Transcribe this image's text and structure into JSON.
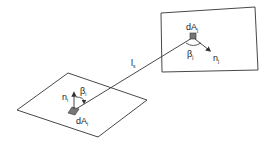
{
  "diagram": {
    "type": "radiative view factor geometry",
    "surface_j": {
      "area_label": "dA",
      "area_sub": "j",
      "normal_label": "n",
      "normal_sub": "j",
      "angle_label": "β",
      "angle_sub": "j"
    },
    "surface_i": {
      "area_label": "dA",
      "area_sub": "i",
      "normal_label": "n",
      "normal_sub": "i",
      "angle_label": "β",
      "angle_sub": "i"
    },
    "connector": {
      "label": "l",
      "sub": "s"
    },
    "colors": {
      "line": "#333333",
      "patch": "#777777",
      "background": "#ffffff"
    }
  }
}
